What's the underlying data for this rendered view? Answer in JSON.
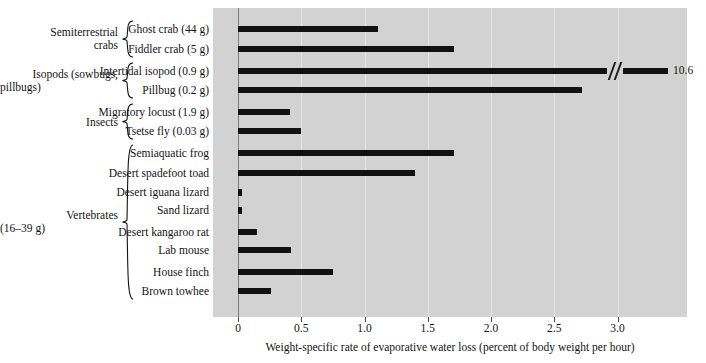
{
  "chart_data": {
    "type": "bar",
    "orientation": "horizontal",
    "title": "",
    "xlabel": "Weight-specific rate of evaporative water loss (percent of body weight per hour)",
    "ylabel": "",
    "xlim": [
      0,
      3.75
    ],
    "xticks": [
      0,
      0.5,
      1.0,
      1.5,
      2.0,
      2.5,
      3.0
    ],
    "xticklabels": [
      "0",
      "0.5",
      "1.0",
      "1.5",
      "2.0",
      "2.5",
      "3.0"
    ],
    "grid": "vertical",
    "legend": "none",
    "bar_color": "#111111",
    "plot_background": "#d2d2d2",
    "categories": [
      "Ghost crab (44 g)",
      "Fiddler crab (5 g)",
      "Intertidal isopod (0.9 g)",
      "Pillbug (0.2 g)",
      "Migratory locust (1.9 g)",
      "Tsetse fly (0.03 g)",
      "Semiaquatic frog",
      "Desert spadefoot toad",
      "Desert iguana lizard",
      "Sand lizard",
      "Desert kangaroo rat",
      "Lab mouse",
      "House finch",
      "Brown towhee"
    ],
    "values": [
      1.11,
      1.71,
      10.6,
      2.72,
      0.41,
      0.5,
      1.71,
      1.4,
      0.03,
      0.03,
      0.15,
      0.42,
      0.75,
      0.26
    ],
    "axis_break": {
      "category": "Intertidal isopod (0.9 g)",
      "value_label": "10.6",
      "note": "bar is broken; true value exceeds axis range"
    },
    "groups": [
      {
        "label": "Semiterrestrial\ncrabs",
        "members": [
          "Ghost crab (44 g)",
          "Fiddler crab (5 g)"
        ]
      },
      {
        "label": "Isopods (sowbugs,\npillbugs)",
        "members": [
          "Intertidal isopod (0.9 g)",
          "Pillbug (0.2 g)"
        ]
      },
      {
        "label": "Insects",
        "members": [
          "Migratory locust (1.9 g)",
          "Tsetse fly (0.03 g)"
        ]
      },
      {
        "label": "Vertebrates\n(16–39 g)",
        "members": [
          "Semiaquatic frog",
          "Desert spadefoot toad",
          "Desert iguana lizard",
          "Sand lizard",
          "Desert kangaroo rat",
          "Lab mouse",
          "House finch",
          "Brown towhee"
        ]
      }
    ]
  },
  "bars": [
    {
      "label": "Ghost crab (44 g)",
      "value": 1.11,
      "broken": false,
      "value_label": ""
    },
    {
      "label": "Fiddler crab (5 g)",
      "value": 1.71,
      "broken": false,
      "value_label": ""
    },
    {
      "label": "Intertidal isopod (0.9 g)",
      "value": 10.6,
      "broken": true,
      "value_label": "10.6"
    },
    {
      "label": "Pillbug (0.2 g)",
      "value": 2.72,
      "broken": false,
      "value_label": ""
    },
    {
      "label": "Migratory locust (1.9 g)",
      "value": 0.41,
      "broken": false,
      "value_label": ""
    },
    {
      "label": "Tsetse fly (0.03 g)",
      "value": 0.5,
      "broken": false,
      "value_label": ""
    },
    {
      "label": "Semiaquatic frog",
      "value": 1.71,
      "broken": false,
      "value_label": ""
    },
    {
      "label": "Desert spadefoot toad",
      "value": 1.4,
      "broken": false,
      "value_label": ""
    },
    {
      "label": "Desert iguana lizard",
      "value": 0.03,
      "broken": false,
      "value_label": ""
    },
    {
      "label": "Sand lizard",
      "value": 0.03,
      "broken": false,
      "value_label": ""
    },
    {
      "label": "Desert kangaroo rat",
      "value": 0.15,
      "broken": false,
      "value_label": ""
    },
    {
      "label": "Lab mouse",
      "value": 0.42,
      "broken": false,
      "value_label": ""
    },
    {
      "label": "House finch",
      "value": 0.75,
      "broken": false,
      "value_label": ""
    },
    {
      "label": "Brown towhee",
      "value": 0.26,
      "broken": false,
      "value_label": ""
    }
  ],
  "groups": [
    {
      "line1": "Semiterrestrial",
      "line2": "crabs"
    },
    {
      "line1": "Isopods (sowbugs,",
      "line2": "pillbugs)"
    },
    {
      "line1": "Insects",
      "line2": ""
    },
    {
      "line1": "Vertebrates",
      "line2": "(16–39 g)"
    }
  ],
  "xaxis": {
    "title": "Weight-specific rate of evaporative water loss (percent of body weight per hour)",
    "ticklabels": [
      "0",
      "0.5",
      "1.0",
      "1.5",
      "2.0",
      "2.5",
      "3.0"
    ]
  }
}
